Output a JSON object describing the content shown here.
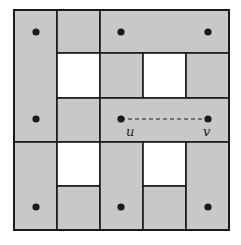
{
  "diagram": {
    "title": "",
    "background": "#ffffff",
    "fill_gray": "#c8c8c8",
    "fill_white": "#ffffff",
    "stroke": "#1a1a1a",
    "outer_box": {
      "x": 14,
      "y": 10,
      "w": 215,
      "h": 220
    },
    "regions": [
      {
        "id": "left-top-tall",
        "x": 14,
        "y": 10,
        "w": 43,
        "h": 132,
        "fill": "gray"
      },
      {
        "id": "r0c1",
        "x": 57,
        "y": 10,
        "w": 43,
        "h": 43,
        "fill": "gray"
      },
      {
        "id": "top-right-wide",
        "x": 100,
        "y": 10,
        "w": 129,
        "h": 43,
        "fill": "gray"
      },
      {
        "id": "r1c1",
        "x": 57,
        "y": 53,
        "w": 43,
        "h": 45,
        "fill": "white"
      },
      {
        "id": "r1c2",
        "x": 100,
        "y": 53,
        "w": 43,
        "h": 45,
        "fill": "gray"
      },
      {
        "id": "r1c3",
        "x": 143,
        "y": 53,
        "w": 43,
        "h": 45,
        "fill": "white"
      },
      {
        "id": "r1c4",
        "x": 186,
        "y": 53,
        "w": 43,
        "h": 45,
        "fill": "gray"
      },
      {
        "id": "r2c1",
        "x": 57,
        "y": 98,
        "w": 43,
        "h": 44,
        "fill": "gray"
      },
      {
        "id": "uv-wide",
        "x": 100,
        "y": 98,
        "w": 129,
        "h": 44,
        "fill": "gray"
      },
      {
        "id": "left-bottom-tall",
        "x": 14,
        "y": 142,
        "w": 43,
        "h": 88,
        "fill": "gray"
      },
      {
        "id": "r3c1",
        "x": 57,
        "y": 142,
        "w": 43,
        "h": 44,
        "fill": "white"
      },
      {
        "id": "r4c1",
        "x": 57,
        "y": 186,
        "w": 43,
        "h": 44,
        "fill": "gray"
      },
      {
        "id": "mid-bottom-tall",
        "x": 100,
        "y": 142,
        "w": 43,
        "h": 88,
        "fill": "gray"
      },
      {
        "id": "r3c3",
        "x": 143,
        "y": 142,
        "w": 43,
        "h": 44,
        "fill": "white"
      },
      {
        "id": "r4c3",
        "x": 143,
        "y": 186,
        "w": 43,
        "h": 44,
        "fill": "gray"
      },
      {
        "id": "right-bottom-tall",
        "x": 186,
        "y": 142,
        "w": 43,
        "h": 88,
        "fill": "gray"
      }
    ],
    "nodes": [
      {
        "x": 36,
        "y": 32,
        "label": ""
      },
      {
        "x": 121,
        "y": 32,
        "label": ""
      },
      {
        "x": 208,
        "y": 32,
        "label": ""
      },
      {
        "x": 36,
        "y": 119,
        "label": ""
      },
      {
        "x": 121,
        "y": 119,
        "label": "u"
      },
      {
        "x": 208,
        "y": 119,
        "label": "v"
      },
      {
        "x": 36,
        "y": 207,
        "label": ""
      },
      {
        "x": 121,
        "y": 207,
        "label": ""
      },
      {
        "x": 208,
        "y": 207,
        "label": ""
      }
    ],
    "dashed_edge": {
      "from": "u",
      "to": "v",
      "x1": 121,
      "y1": 119,
      "x2": 208,
      "y2": 119
    },
    "labels": {
      "u": "u",
      "v": "v"
    }
  }
}
